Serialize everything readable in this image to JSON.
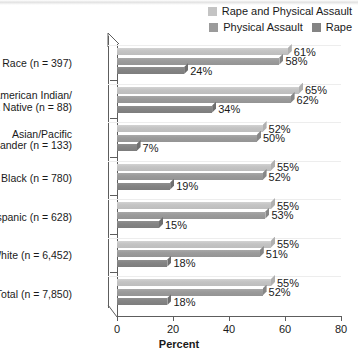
{
  "chart_data": {
    "type": "bar",
    "orientation": "horizontal",
    "title": "",
    "xlabel": "Percent",
    "ylabel": "",
    "xlim": [
      0,
      80
    ],
    "xticks": [
      0,
      20,
      40,
      60,
      80
    ],
    "grid": false,
    "legend_position": "top-right",
    "categories": [
      "Mixed Race (n = 397)",
      "American Indian/\nAlaska Native (n = 88)",
      "Asian/Pacific\nIslander (n = 133)",
      "Black (n = 780)",
      "Hispanic (n = 628)",
      "White (n = 6,452)",
      "Total (n = 7,850)"
    ],
    "series": [
      {
        "name": "Rape and Physical Assault",
        "color": "#c4c4c4",
        "values": [
          61,
          65,
          52,
          55,
          55,
          55,
          55
        ],
        "labels": [
          "61%",
          "65%",
          "52%",
          "55%",
          "55%",
          "55%",
          "55%"
        ]
      },
      {
        "name": "Physical Assault",
        "color": "#9b9b9b",
        "values": [
          58,
          62,
          50,
          52,
          53,
          51,
          52
        ],
        "labels": [
          "58%",
          "62%",
          "50%",
          "52%",
          "53%",
          "51%",
          "52%"
        ]
      },
      {
        "name": "Rape",
        "color": "#848484",
        "values": [
          24,
          34,
          7,
          19,
          15,
          18,
          18
        ],
        "labels": [
          "24%",
          "34%",
          "7%",
          "19%",
          "15%",
          "18%",
          "18%"
        ]
      }
    ]
  },
  "axis": {
    "x_title": "Percent",
    "tick_labels": [
      "0",
      "20",
      "40",
      "60",
      "80"
    ]
  },
  "category_labels": [
    {
      "lines": [
        "Mixed Race (n = 397)"
      ]
    },
    {
      "lines": [
        "American Indian/",
        "Alaska Native (n = 88)"
      ]
    },
    {
      "lines": [
        "Asian/Pacific",
        "Islander (n = 133)"
      ]
    },
    {
      "lines": [
        "Black (n = 780)"
      ]
    },
    {
      "lines": [
        "Hispanic (n = 628)"
      ]
    },
    {
      "lines": [
        "White (n = 6,452)"
      ]
    },
    {
      "lines": [
        "Total (n = 7,850)"
      ]
    }
  ],
  "legend": {
    "row1": [
      {
        "label": "Rape and Physical Assault",
        "color": "#c4c4c4"
      }
    ],
    "row2": [
      {
        "label": "Physical Assault",
        "color": "#9b9b9b"
      },
      {
        "label": "Rape",
        "color": "#848484"
      }
    ]
  }
}
